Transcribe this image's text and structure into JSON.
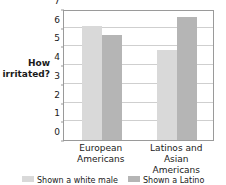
{
  "chart_data": {
    "type": "bar",
    "title": "",
    "xlabel": "",
    "ylabel": "How irritated?",
    "ylabel_lines": [
      "How",
      "irritated?"
    ],
    "ylim": [
      0,
      7
    ],
    "yticks": [
      0,
      1,
      2,
      3,
      4,
      5,
      6,
      7
    ],
    "ytick_labels": [
      "0",
      "1",
      "2",
      "3",
      "4",
      "5",
      "6",
      "7"
    ],
    "grid": true,
    "grid_axis": "y",
    "legend_position": "bottom",
    "categories": [
      "European Americans",
      "Latinos and Asian Americans"
    ],
    "category_lines": [
      [
        "European",
        "Americans"
      ],
      [
        "Latinos and Asian",
        "Americans"
      ]
    ],
    "series": [
      {
        "name": "Shown a white male",
        "color": "#d9d9d9",
        "values": [
          6.1,
          4.8
        ]
      },
      {
        "name": "Shown a Latino",
        "color": "#b5b5b5",
        "values": [
          5.6,
          6.6
        ]
      }
    ]
  },
  "legend": {
    "entries": [
      {
        "label": "Shown a white male",
        "color": "#d9d9d9"
      },
      {
        "label": "Shown a Latino",
        "color": "#b5b5b5"
      }
    ]
  },
  "colors": {
    "axis": "#9a9a9a",
    "grid": "#cfcfcf",
    "text": "#1a1a1a",
    "series_light": "#d9d9d9",
    "series_dark": "#b5b5b5",
    "background": "#ffffff"
  }
}
